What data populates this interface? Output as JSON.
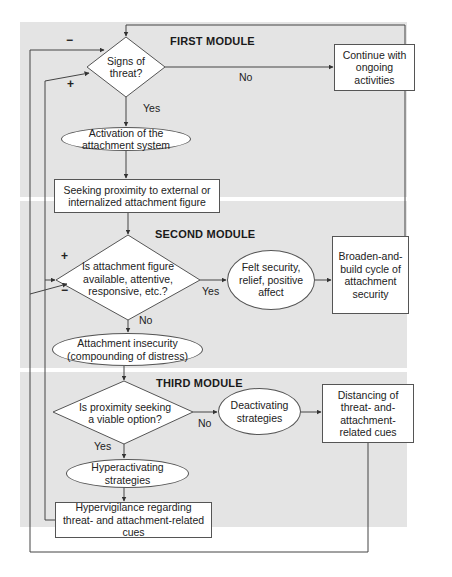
{
  "modules": {
    "first": "FIRST MODULE",
    "second": "SECOND MODULE",
    "third": "THIRD MODULE"
  },
  "nodes": {
    "signs_of_threat": "Signs of threat?",
    "continue_activities": "Continue with ongoing activities",
    "activation": "Activation of the attachment system",
    "seeking_proximity": "Seeking proximity to external or internalized attachment figure",
    "is_figure_available": "Is attachment figure available, attentive, responsive, etc.?",
    "felt_security": "Felt security, relief, positive affect",
    "broaden_build": "Broaden-and-build cycle of attachment security",
    "attachment_insecurity": "Attachment insecurity (compounding of distress)",
    "proximity_viable": "Is proximity seeking a viable option?",
    "deactivating": "Deactivating strategies",
    "distancing": "Distancing of threat- and-attachment-related cues",
    "hyperactivating": "Hyperactivating strategies",
    "hypervigilance": "Hypervigilance regarding threat- and attachment-related cues"
  },
  "edge_labels": {
    "threat_no": "No",
    "threat_yes": "Yes",
    "available_yes": "Yes",
    "available_no": "No",
    "viable_no": "No",
    "viable_yes": "Yes"
  },
  "signs": {
    "first_minus": "−",
    "first_plus": "+",
    "second_plus": "+",
    "second_minus": "−"
  },
  "colors": {
    "panel": "#e4e4e4",
    "line": "#444444",
    "node_fill": "#ffffff"
  }
}
